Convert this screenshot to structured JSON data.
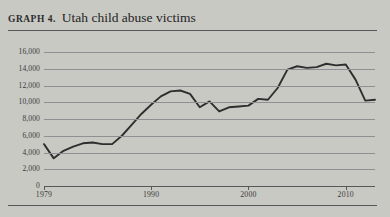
{
  "figure": {
    "label": "Graph 4.",
    "title": "Utah child abuse victims"
  },
  "colors": {
    "page_background": "#c9c9c4",
    "rule": "#54585c",
    "gridline": "#8e9094",
    "series_line": "#2e2e2e",
    "axis_text": "#3a3a3a"
  },
  "chart_data": {
    "type": "line",
    "title": "Utah child abuse victims",
    "xlabel": "",
    "ylabel": "",
    "xlim": [
      1979,
      2013
    ],
    "ylim": [
      0,
      16000
    ],
    "grid": true,
    "legend": "none",
    "y_ticks": [
      0,
      2000,
      4000,
      6000,
      8000,
      10000,
      12000,
      14000,
      16000
    ],
    "y_tick_labels": [
      "0",
      "2,000",
      "4,000",
      "6,000",
      "8,000",
      "10,000",
      "12,000",
      "14,000",
      "16,000"
    ],
    "x_ticks": [
      1979,
      1990,
      2000,
      2010
    ],
    "x_tick_labels": [
      "1979",
      "1990",
      "2000",
      "2010"
    ],
    "series": [
      {
        "name": "Utah child abuse victims",
        "x": [
          1979,
          1980,
          1981,
          1982,
          1983,
          1984,
          1985,
          1986,
          1987,
          1988,
          1989,
          1990,
          1991,
          1992,
          1993,
          1994,
          1995,
          1996,
          1997,
          1998,
          1999,
          2000,
          2001,
          2002,
          2003,
          2004,
          2005,
          2006,
          2007,
          2008,
          2009,
          2010,
          2011,
          2012,
          2013
        ],
        "values": [
          5000,
          3300,
          4200,
          4700,
          5100,
          5200,
          5000,
          5000,
          6000,
          7300,
          8600,
          9700,
          10700,
          11300,
          11400,
          11000,
          9400,
          10100,
          8900,
          9400,
          9500,
          9600,
          10400,
          10300,
          11700,
          13900,
          14300,
          14100,
          14200,
          14600,
          14400,
          14500,
          12700,
          10200,
          10300
        ]
      }
    ]
  }
}
